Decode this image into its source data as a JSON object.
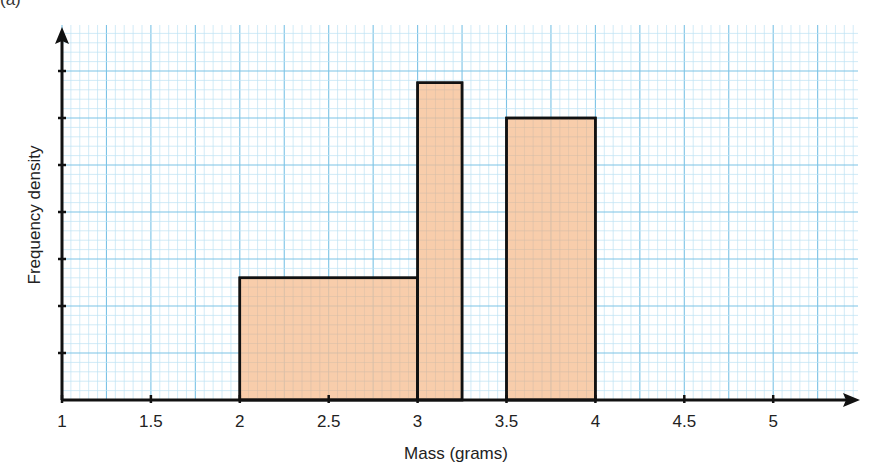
{
  "part_label": "(a)",
  "chart_data": {
    "type": "bar",
    "subtype": "histogram",
    "title": "",
    "xlabel": "Mass (grams)",
    "ylabel": "Frequency density",
    "x_ticks": [
      "1",
      "1.5",
      "2",
      "2.5",
      "3",
      "3.5",
      "4",
      "4.5",
      "5"
    ],
    "x_tick_values": [
      1,
      1.5,
      2,
      2.5,
      3,
      3.5,
      4,
      4.5,
      5
    ],
    "xlim": [
      1,
      5.25
    ],
    "y_ticks_labeled": false,
    "y_tick_count": 7,
    "ylim_ticks": [
      0,
      7.5
    ],
    "grid": true,
    "bins": [
      {
        "x_start": 2,
        "x_end": 3,
        "height_ticks": 2.6
      },
      {
        "x_start": 3,
        "x_end": 3.25,
        "height_ticks": 6.75
      },
      {
        "x_start": 3.5,
        "x_end": 4,
        "height_ticks": 6
      }
    ],
    "categories": [
      "2-3",
      "3-3.25",
      "3.5-4"
    ],
    "values": [
      2.6,
      6.75,
      6
    ],
    "colors": {
      "bar_fill": "#f7c49c",
      "bar_stroke": "#111111",
      "grid_minor": "#bfe3f3",
      "grid_major": "#7cc3e6",
      "axis": "#111111"
    }
  }
}
